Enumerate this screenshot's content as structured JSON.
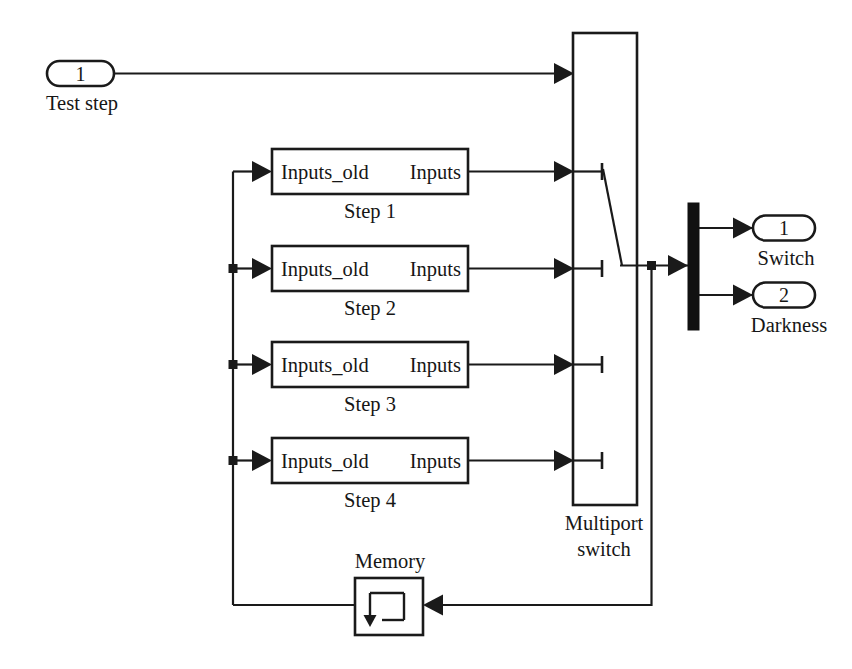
{
  "diagram": {
    "background_color": "#ffffff",
    "line_color": "#1a1a1a",
    "block_fill": "#ffffff",
    "demux_color": "#111111"
  },
  "input_ports": [
    {
      "number": "1",
      "label": "Test step"
    }
  ],
  "output_ports": [
    {
      "number": "1",
      "label": "Switch"
    },
    {
      "number": "2",
      "label": "Darkness"
    }
  ],
  "step_blocks": [
    {
      "caption": "Step 1",
      "input_label": "Inputs_old",
      "output_label": "Inputs"
    },
    {
      "caption": "Step 2",
      "input_label": "Inputs_old",
      "output_label": "Inputs"
    },
    {
      "caption": "Step 3",
      "input_label": "Inputs_old",
      "output_label": "Inputs"
    },
    {
      "caption": "Step 4",
      "input_label": "Inputs_old",
      "output_label": "Inputs"
    }
  ],
  "multiport_switch": {
    "caption_line1": "Multiport",
    "caption_line2": "switch",
    "control_port_index": "1",
    "data_port_count": "4"
  },
  "memory_block": {
    "caption": "Memory",
    "icon": "memory-loop-icon"
  },
  "demux": {
    "name": "demux-bar",
    "output_count": "2"
  }
}
